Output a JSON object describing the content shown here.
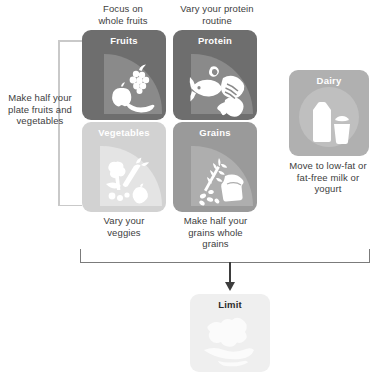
{
  "diagram": {
    "colors": {
      "fruits_tile": "#6e6e6e",
      "fruits_wedge": "#8a8a8a",
      "protein_tile": "#6e6e6e",
      "protein_wedge": "#8a8a8a",
      "vegetables_tile": "#d2d2d2",
      "vegetables_wedge": "#e2e2e2",
      "grains_tile": "#9a9a9a",
      "grains_wedge": "#ababab",
      "dairy_tile": "#b0b0b0",
      "dairy_disc": "#bdbdbd",
      "limit_tile": "#efefef",
      "limit_glyph": "#fbfbfb",
      "bracket": "#7b7b7b",
      "bracket_light": "#c9c9c9",
      "text": "#404040",
      "tile_label_light": "#ffffff",
      "tile_label_dark": "#2b2b2b"
    }
  },
  "tiles": [
    {
      "id": "fruits",
      "label": "Fruits",
      "caption_above": "Focus on\nwhole fruits",
      "icon": "fruits-icon"
    },
    {
      "id": "protein",
      "label": "Protein",
      "caption_above": "Vary your protein\nroutine",
      "icon": "protein-icon"
    },
    {
      "id": "vegetables",
      "label": "Vegetables",
      "caption_below": "Vary your\nveggies",
      "icon": "vegetables-icon"
    },
    {
      "id": "grains",
      "label": "Grains",
      "caption_below": "Make half your\ngrains whole\ngrains",
      "icon": "grains-icon"
    },
    {
      "id": "dairy",
      "label": "Dairy",
      "caption_below": "Move to low-fat or\nfat-free milk or\nyogurt",
      "icon": "dairy-icon"
    },
    {
      "id": "limit",
      "label": "Limit",
      "icon": "limit-icon"
    }
  ],
  "captions": {
    "fruits_above_line1": "Focus on",
    "fruits_above_line2": "whole fruits",
    "protein_above_line1": "Vary your protein",
    "protein_above_line2": "routine",
    "left_bracket_line1": "Make half your",
    "left_bracket_line2": "plate fruits and",
    "left_bracket_line3": "vegetables",
    "vegetables_below_line1": "Vary your",
    "vegetables_below_line2": "veggies",
    "grains_below_line1": "Make half your",
    "grains_below_line2": "grains whole",
    "grains_below_line3": "grains",
    "dairy_below_line1": "Move to low-fat or",
    "dairy_below_line2": "fat-free milk or",
    "dairy_below_line3": "yogurt"
  },
  "labels": {
    "fruits": "Fruits",
    "protein": "Protein",
    "vegetables": "Vegetables",
    "grains": "Grains",
    "dairy": "Dairy",
    "limit": "Limit"
  }
}
